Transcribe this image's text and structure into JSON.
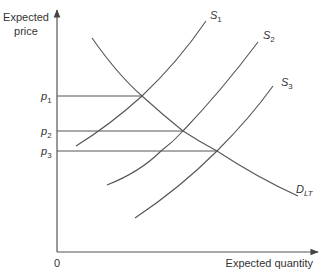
{
  "diagram": {
    "y_axis_label_line1": "Expected",
    "y_axis_label_line2": "price",
    "x_axis_label": "Expected quantity",
    "origin_label": "0",
    "price_levels": [
      {
        "main": "p",
        "sub": "1"
      },
      {
        "main": "p",
        "sub": "2"
      },
      {
        "main": "p",
        "sub": "3"
      }
    ],
    "curves": {
      "s1": {
        "main": "S",
        "sub": "1"
      },
      "s2": {
        "main": "S",
        "sub": "2"
      },
      "s3": {
        "main": "S",
        "sub": "3"
      },
      "demand": {
        "main": "D",
        "sub": "LT"
      }
    },
    "line_color": "#555555"
  }
}
